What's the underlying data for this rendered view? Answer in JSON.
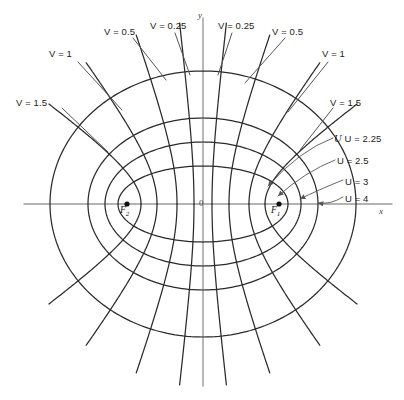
{
  "figure": {
    "type": "confocal-ellipses-hyperbolas",
    "origin_label": "0",
    "axis_x_label": "x",
    "axis_y_label": "y",
    "focus_right_label": "F",
    "focus_right_sub": "1",
    "focus_left_label": "F",
    "focus_left_sub": "2",
    "line_color": "#2b2b2b",
    "axis_color": "#9a9a9a",
    "leader_color": "#555555",
    "background": "#ffffff"
  },
  "labels": {
    "u": [
      {
        "text": "U = 2.25",
        "value": 2.25
      },
      {
        "text": "U = 2.5",
        "value": 2.5
      },
      {
        "text": "U = 3",
        "value": 3
      },
      {
        "text": "U = 4",
        "value": 4
      }
    ],
    "v_left": [
      {
        "text": "V = 1.5",
        "value": 1.5
      },
      {
        "text": "V = 1",
        "value": 1
      },
      {
        "text": "V = 0.5",
        "value": 0.5
      },
      {
        "text": "V = 0.25",
        "value": 0.25
      }
    ],
    "v_right": [
      {
        "text": "V = 0.25",
        "value": 0.25
      },
      {
        "text": "V = 0.5",
        "value": 0.5
      },
      {
        "text": "V = 1",
        "value": 1
      },
      {
        "text": "V = 1.5",
        "value": 1.5
      }
    ]
  },
  "chart_data": {
    "type": "line",
    "title": "",
    "xlabel": "x",
    "ylabel": "y",
    "center": {
      "x": 203,
      "y": 204
    },
    "focal_half_distance_px": 76,
    "foci": [
      {
        "name": "F1",
        "x": 279,
        "y": 204
      },
      {
        "name": "F2",
        "x": 127,
        "y": 204
      }
    ],
    "ellipses_u": [
      {
        "u": 2.25,
        "semi_major_px": 85,
        "semi_minor_px": 38
      },
      {
        "u": 2.5,
        "semi_major_px": 98,
        "semi_minor_px": 62
      },
      {
        "u": 3,
        "semi_major_px": 115,
        "semi_minor_px": 86
      },
      {
        "u": 4,
        "semi_major_px": 153,
        "semi_minor_px": 133
      }
    ],
    "hyperbolas_v": [
      {
        "v": 0.25,
        "a_px": 9
      },
      {
        "v": 0.5,
        "a_px": 26
      },
      {
        "v": 1.0,
        "a_px": 46
      },
      {
        "v": 1.5,
        "a_px": 62
      }
    ],
    "grid": false,
    "legend": "none"
  }
}
